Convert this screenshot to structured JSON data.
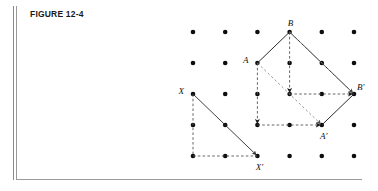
{
  "figure": {
    "title": "FIGURE 12-4",
    "caption_number": "12-4"
  },
  "colors": {
    "ink": "#111111",
    "dot": "#0d0d0d",
    "solid_line": "#2b2b2b",
    "dashed_line": "#555555",
    "dashed_light": "#8d8d8d",
    "border": "#9a9a9a",
    "background": "#ffffff"
  },
  "grid": {
    "columns": 6,
    "rows": 5,
    "x_start": 193,
    "y_start": 32,
    "x_step": 32.2,
    "y_step": 31,
    "dot_radius": 2.3
  },
  "points": [
    {
      "id": "A",
      "label": "A",
      "col": 2,
      "row": 1,
      "label_dx": -9,
      "label_dy": -2,
      "anchor": "end"
    },
    {
      "id": "B",
      "label": "B",
      "col": 3,
      "row": 0,
      "label_dx": 1,
      "label_dy": -8,
      "anchor": "middle"
    },
    {
      "id": "Ap",
      "label": "A'",
      "col": 4,
      "row": 3,
      "label_dx": 2,
      "label_dy": 12,
      "anchor": "middle"
    },
    {
      "id": "Bp",
      "label": "B'",
      "col": 5,
      "row": 2,
      "label_dx": 3,
      "label_dy": -6,
      "anchor": "start"
    },
    {
      "id": "X",
      "label": "X",
      "col": 0,
      "row": 2,
      "label_dx": -9,
      "label_dy": -2,
      "anchor": "end"
    },
    {
      "id": "Xp",
      "label": "X'",
      "col": 2,
      "row": 4,
      "label_dx": 2,
      "label_dy": 12,
      "anchor": "middle"
    }
  ],
  "solid_segments": [
    {
      "name": "segment-A-B",
      "from": "A",
      "to": "B"
    },
    {
      "name": "segment-B-Bprime",
      "from": "B",
      "to": "Bp"
    },
    {
      "name": "segment-Aprime-Bprime",
      "from": "Ap",
      "to": "Bp"
    }
  ],
  "arrows": [
    {
      "name": "vector-X-to-Xprime",
      "from": "X",
      "to": "Xp",
      "style": "solid"
    },
    {
      "name": "vector-A-down",
      "from": "A",
      "to": "A_down",
      "style": "dashed"
    },
    {
      "name": "vector-A-right",
      "from": "A_down",
      "to": "Ap",
      "style": "dashed"
    },
    {
      "name": "vector-B-down",
      "from": "B",
      "to": "B_down",
      "style": "dashed"
    },
    {
      "name": "vector-B-right",
      "from": "B_down",
      "to": "Bp",
      "style": "dashed"
    },
    {
      "name": "vector-A-to-Aprime",
      "from": "A",
      "to": "Ap",
      "style": "dashed-light"
    },
    {
      "name": "vector-B-to-Bprime",
      "from": "B",
      "to": "Bp",
      "style": "dashed-light"
    }
  ],
  "dashed_paths": [
    {
      "name": "path-X-down",
      "from": "X",
      "to": "X_down"
    },
    {
      "name": "path-X-right",
      "from": "X_down",
      "to": "Xp"
    }
  ],
  "notes": {
    "description": "Translation diagram: triangle A-B mapped to A'-B' by translation vector X to X'."
  }
}
